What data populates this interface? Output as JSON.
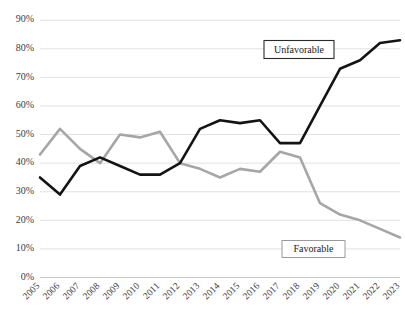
{
  "chart_data": {
    "type": "line",
    "title": "",
    "subtitle": "",
    "xlabel": "",
    "ylabel": "",
    "x": [
      "2005",
      "2006",
      "2007",
      "2008",
      "2009",
      "2010",
      "2011",
      "2012",
      "2013",
      "2014",
      "2015",
      "2016",
      "2017",
      "2018",
      "2019",
      "2020",
      "2021",
      "2022",
      "2023"
    ],
    "categories": [
      "2005",
      "2006",
      "2007",
      "2008",
      "2009",
      "2010",
      "2011",
      "2012",
      "2013",
      "2014",
      "2015",
      "2016",
      "2017",
      "2018",
      "2019",
      "2020",
      "2021",
      "2022",
      "2023"
    ],
    "series": [
      {
        "name": "Unfavorable",
        "color": "#141414",
        "values": [
          35,
          29,
          39,
          42,
          39,
          36,
          36,
          40,
          52,
          55,
          54,
          55,
          47,
          47,
          60,
          73,
          76,
          82,
          83
        ]
      },
      {
        "name": "Favorable",
        "color": "#a6a6a6",
        "values": [
          43,
          52,
          45,
          40,
          50,
          49,
          51,
          40,
          38,
          35,
          38,
          37,
          44,
          42,
          26,
          22,
          20,
          17,
          14
        ]
      }
    ],
    "ylim": [
      0,
      90
    ],
    "yticks": [
      0,
      10,
      20,
      30,
      40,
      50,
      60,
      70,
      80,
      90
    ],
    "ytick_labels": [
      "0%",
      "10%",
      "20%",
      "30%",
      "40%",
      "50%",
      "60%",
      "70%",
      "80%",
      "90%"
    ],
    "xtick_labels": [
      "2005",
      "2006",
      "2007",
      "2008",
      "2009",
      "2010",
      "2011",
      "2012",
      "2013",
      "2014",
      "2015",
      "2016",
      "2017",
      "2018",
      "2019",
      "2020",
      "2021",
      "2022",
      "2023"
    ],
    "grid": true,
    "grid_axis": "y",
    "legend_position": "inline-annotations",
    "annotations": [
      {
        "text": "Unfavorable",
        "series": "Unfavorable",
        "x_value": "2018",
        "y_value": 78
      },
      {
        "text": "Favorable",
        "series": "Favorable",
        "x_value": "2019",
        "y_value": 10
      }
    ]
  },
  "colors": {
    "unfavorable": "#141414",
    "favorable": "#a6a6a6",
    "gridline": "#d9d9d9",
    "text": "#3b3b3b",
    "background": "#ffffff"
  }
}
